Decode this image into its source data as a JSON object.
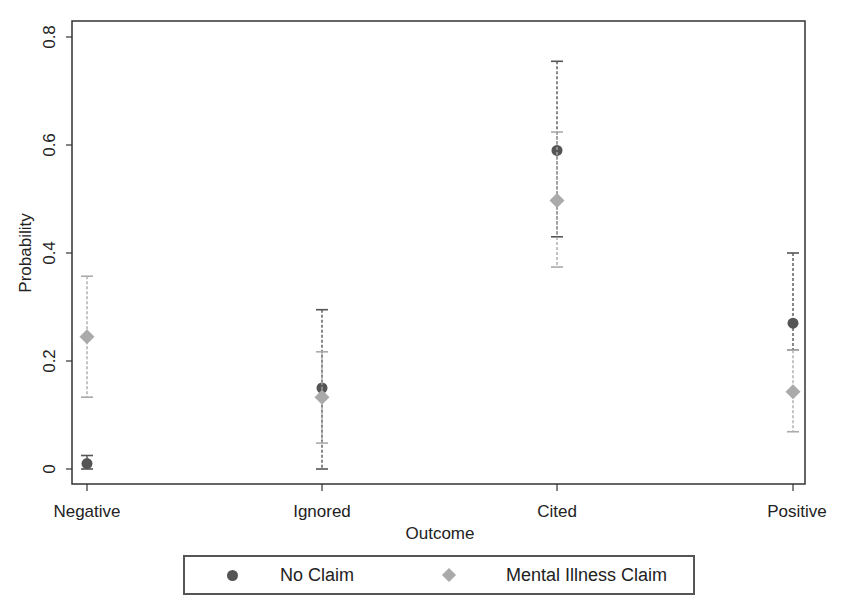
{
  "chart_data": {
    "type": "scatter",
    "subtype": "point-with-confidence-intervals",
    "title": "",
    "xlabel": "Outcome",
    "ylabel": "Probability",
    "ylim": [
      0,
      0.8
    ],
    "yticks": [
      "0",
      "0.2",
      "0.4",
      "0.6",
      "0.8"
    ],
    "categories": [
      "Negative",
      "Ignored",
      "Cited",
      "Positive"
    ],
    "grid": false,
    "legend_position": "bottom",
    "series": [
      {
        "name": "No Claim",
        "marker": "circle",
        "color": "#555555",
        "values": [
          0.01,
          0.15,
          0.59,
          0.27
        ],
        "ci_low": [
          0.0,
          0.0,
          0.43,
          0.22
        ],
        "ci_high": [
          0.025,
          0.295,
          0.755,
          0.4
        ]
      },
      {
        "name": "Mental Illness Claim",
        "marker": "diamond",
        "color": "#aaaaaa",
        "values": [
          0.245,
          0.133,
          0.497,
          0.143
        ],
        "ci_low": [
          0.133,
          0.048,
          0.374,
          0.069
        ],
        "ci_high": [
          0.357,
          0.217,
          0.624,
          0.22
        ]
      }
    ]
  },
  "legend": {
    "items": [
      {
        "label": "No Claim"
      },
      {
        "label": "Mental Illness Claim"
      }
    ]
  }
}
